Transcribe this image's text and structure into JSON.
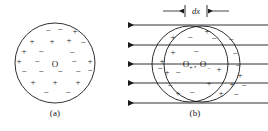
{
  "figure": {
    "panel_a": {
      "caption": "(a)",
      "center_label": "O",
      "circle": {
        "cx": 55,
        "cy": 63,
        "r": 40
      },
      "charges": [
        {
          "s": "−",
          "x": 48,
          "y": 33
        },
        {
          "s": "−",
          "x": 60,
          "y": 32
        },
        {
          "s": "+",
          "x": 75,
          "y": 34
        },
        {
          "s": "+",
          "x": 32,
          "y": 44
        },
        {
          "s": "+",
          "x": 52,
          "y": 44
        },
        {
          "s": "+",
          "x": 69,
          "y": 43
        },
        {
          "s": "−",
          "x": 83,
          "y": 45
        },
        {
          "s": "+",
          "x": 24,
          "y": 54
        },
        {
          "s": "−",
          "x": 41,
          "y": 54
        },
        {
          "s": "−",
          "x": 72,
          "y": 55
        },
        {
          "s": "+",
          "x": 19,
          "y": 64
        },
        {
          "s": "−",
          "x": 37,
          "y": 64
        },
        {
          "s": "−",
          "x": 74,
          "y": 64
        },
        {
          "s": "+",
          "x": 90,
          "y": 64
        },
        {
          "s": "−",
          "x": 24,
          "y": 74
        },
        {
          "s": "−",
          "x": 41,
          "y": 74
        },
        {
          "s": "−",
          "x": 60,
          "y": 74
        },
        {
          "s": "−",
          "x": 78,
          "y": 74
        },
        {
          "s": "−",
          "x": 90,
          "y": 73
        },
        {
          "s": "+",
          "x": 33,
          "y": 85
        },
        {
          "s": "+",
          "x": 55,
          "y": 85
        },
        {
          "s": "+",
          "x": 78,
          "y": 85
        },
        {
          "s": "−",
          "x": 46,
          "y": 95
        },
        {
          "s": "−",
          "x": 68,
          "y": 95
        }
      ]
    },
    "panel_b": {
      "caption": "(b)",
      "center_label_positive": "O",
      "center_label_positive_sub": "+",
      "center_label_negative": "O",
      "center_label_negative_sub": "−",
      "center_separator": ",",
      "dx_label": "dx",
      "circle_positive": {
        "cx": 190,
        "cy": 64,
        "r": 38
      },
      "circle_negative": {
        "cx": 202,
        "cy": 64,
        "r": 38
      },
      "field_lines": [
        {
          "y": 25,
          "x1": 128,
          "x2": 268
        },
        {
          "y": 45,
          "x1": 128,
          "x2": 268
        },
        {
          "y": 64,
          "x1": 128,
          "x2": 268
        },
        {
          "y": 83,
          "x1": 128,
          "x2": 268
        },
        {
          "y": 103,
          "x1": 128,
          "x2": 268
        }
      ],
      "field_direction": "left",
      "dx_marker": {
        "tick_left_x": 185,
        "tick_right_x": 207,
        "y": 11,
        "arrow_left_start": 163,
        "arrow_right_start": 229
      },
      "charges": [
        {
          "s": "+",
          "x": 173,
          "y": 40
        },
        {
          "s": "−",
          "x": 190,
          "y": 40
        },
        {
          "s": "+",
          "x": 207,
          "y": 34
        },
        {
          "s": "−",
          "x": 214,
          "y": 41
        },
        {
          "s": "−",
          "x": 231,
          "y": 42
        },
        {
          "s": "+",
          "x": 173,
          "y": 55
        },
        {
          "s": "−",
          "x": 196,
          "y": 54
        },
        {
          "s": "−",
          "x": 235,
          "y": 56
        },
        {
          "s": "+",
          "x": 162,
          "y": 64
        },
        {
          "s": "−",
          "x": 160,
          "y": 71
        },
        {
          "s": "+",
          "x": 167,
          "y": 75
        },
        {
          "s": "−",
          "x": 178,
          "y": 75
        },
        {
          "s": "+",
          "x": 219,
          "y": 72
        },
        {
          "s": "−",
          "x": 238,
          "y": 68
        },
        {
          "s": "+",
          "x": 240,
          "y": 78
        },
        {
          "s": "−",
          "x": 170,
          "y": 88
        },
        {
          "s": "+",
          "x": 209,
          "y": 86
        },
        {
          "s": "+",
          "x": 232,
          "y": 87
        },
        {
          "s": "−",
          "x": 244,
          "y": 88
        },
        {
          "s": "+",
          "x": 178,
          "y": 96
        },
        {
          "s": "−",
          "x": 192,
          "y": 95
        },
        {
          "s": "+",
          "x": 221,
          "y": 96
        },
        {
          "s": "−",
          "x": 236,
          "y": 97
        }
      ]
    }
  }
}
